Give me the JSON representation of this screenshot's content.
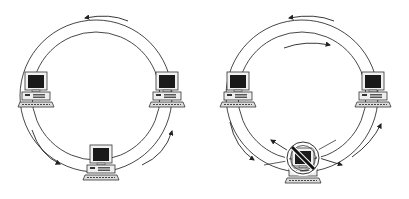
{
  "diagram": {
    "type": "ring-network-topology",
    "panels": [
      {
        "id": "normal-ring",
        "description": "Ring network with three workstations; traffic flows around the dual ring",
        "nodes": [
          "workstation-left",
          "workstation-right",
          "workstation-bottom"
        ],
        "status": "all-operational"
      },
      {
        "id": "failed-node-ring",
        "description": "Ring network where the bottom workstation has failed; traffic wraps back on the secondary ring",
        "nodes": [
          "workstation-left",
          "workstation-right",
          "workstation-bottom-failed"
        ],
        "status": "node-failure"
      }
    ],
    "colors": {
      "line": "#333333",
      "screen": "#1a1a1a",
      "monitor": "#f2f2f2",
      "background": "#ffffff"
    }
  }
}
